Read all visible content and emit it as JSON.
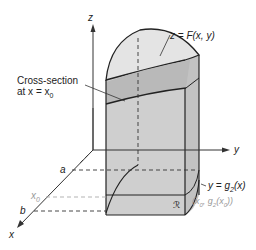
{
  "axes": {
    "z_label": "z",
    "y_label": "y",
    "x_label": "x"
  },
  "labels": {
    "surface": "z = F(x, y)",
    "cross_section_line1": "Cross-section",
    "cross_section_line2": "at x = x",
    "cross_section_sub": "0",
    "boundary_curve": "y = g",
    "boundary_sub": "2",
    "boundary_tail": "(x)",
    "point": "(x",
    "point_sub0": "0",
    "point_mid": ", g",
    "point_sub2": "2",
    "point_mid2": "(x",
    "point_sub0b": "0",
    "point_end": "))",
    "region": "ℛ",
    "tick_a": "a",
    "tick_x0": "x",
    "tick_x0_sub": "0",
    "tick_b": "b"
  },
  "colors": {
    "solid_fill": "#d4d4d4",
    "surface_fill": "#e2e2e2",
    "cross_section_fill": "#bdbdbd",
    "side_fill": "#c9c9c9",
    "axis": "#333333",
    "gray_text": "#9a9a9a"
  }
}
